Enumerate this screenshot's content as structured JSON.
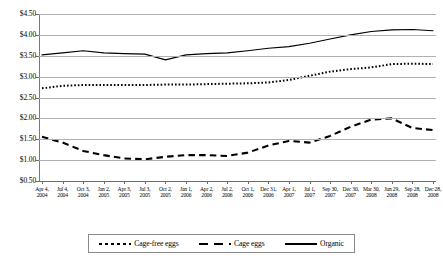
{
  "chart_data": {
    "type": "line",
    "title": "",
    "subtitle": "",
    "xlabel": "",
    "ylabel": "",
    "ylim": [
      0.5,
      4.5
    ],
    "ytick_step": 0.5,
    "ytick_labels": [
      "$4.50",
      "$4.00",
      "$3.50",
      "$3.00",
      "$2.50",
      "$2.00",
      "$1.50",
      "$1.00",
      "$0.50"
    ],
    "ytick_values": [
      4.5,
      4.0,
      3.5,
      3.0,
      2.5,
      2.0,
      1.5,
      1.0,
      0.5
    ],
    "grid": true,
    "legend_position": "bottom",
    "x": [
      "Apr 4, 2004",
      "Jul 4, 2004",
      "Oct 3, 2004",
      "Jan 2, 2005",
      "Apr 3, 2005",
      "Jul 3, 2005",
      "Oct 2, 2005",
      "Jan 1, 2006",
      "Apr 2, 2006",
      "Jul 2, 2006",
      "Oct 1, 2006",
      "Dec 31, 2006",
      "Apr 1, 2007",
      "Jul 1, 2007",
      "Sep 30, 2007",
      "Dec 30, 2007",
      "Mar 30, 2008",
      "Jun 29, 2008",
      "Sep 28, 2008",
      "Dec 28, 2008"
    ],
    "x_labels": [
      {
        "line1": "Apr 4,",
        "line2": "2004"
      },
      {
        "line1": "Jul 4,",
        "line2": "2004"
      },
      {
        "line1": "Oct 3,",
        "line2": "2004"
      },
      {
        "line1": "Jan 2,",
        "line2": "2005"
      },
      {
        "line1": "Apr 3,",
        "line2": "2005"
      },
      {
        "line1": "Jul 3,",
        "line2": "2005"
      },
      {
        "line1": "Oct 2,",
        "line2": "2005"
      },
      {
        "line1": "Jan 1,",
        "line2": "2006"
      },
      {
        "line1": "Apr 2,",
        "line2": "2006"
      },
      {
        "line1": "Jul 2,",
        "line2": "2006"
      },
      {
        "line1": "Oct 1,",
        "line2": "2006"
      },
      {
        "line1": "Dec 31,",
        "line2": "2006"
      },
      {
        "line1": "Apr 1,",
        "line2": "2007"
      },
      {
        "line1": "Jul 1,",
        "line2": "2007"
      },
      {
        "line1": "Sep 30,",
        "line2": "2007"
      },
      {
        "line1": "Dec 30,",
        "line2": "2007"
      },
      {
        "line1": "Mar 30,",
        "line2": "2008"
      },
      {
        "line1": "Jun 29,",
        "line2": "2008"
      },
      {
        "line1": "Sep 28,",
        "line2": "2008"
      },
      {
        "line1": "Dec 28,",
        "line2": "2008"
      }
    ],
    "series": [
      {
        "name": "Cage-free eggs",
        "style": "dotted",
        "color": "#000000",
        "values": [
          2.72,
          2.78,
          2.8,
          2.8,
          2.8,
          2.8,
          2.81,
          2.81,
          2.82,
          2.83,
          2.84,
          2.86,
          2.92,
          3.02,
          3.12,
          3.18,
          3.22,
          3.3,
          3.31,
          3.3
        ]
      },
      {
        "name": "Cage eggs",
        "style": "dashed",
        "color": "#000000",
        "values": [
          1.56,
          1.42,
          1.22,
          1.12,
          1.04,
          1.02,
          1.08,
          1.12,
          1.12,
          1.1,
          1.18,
          1.35,
          1.46,
          1.42,
          1.58,
          1.8,
          1.97,
          2.0,
          1.77,
          1.72
        ]
      },
      {
        "name": "Organic",
        "style": "solid",
        "color": "#000000",
        "values": [
          3.52,
          3.57,
          3.62,
          3.57,
          3.55,
          3.54,
          3.4,
          3.52,
          3.55,
          3.57,
          3.62,
          3.68,
          3.72,
          3.8,
          3.9,
          4.0,
          4.08,
          4.12,
          4.13,
          4.1
        ]
      }
    ],
    "legend": [
      {
        "label": "Cage-free eggs",
        "style": "dotted"
      },
      {
        "label": "Cage eggs",
        "style": "dashed"
      },
      {
        "label": "Organic",
        "style": "solid"
      }
    ]
  }
}
